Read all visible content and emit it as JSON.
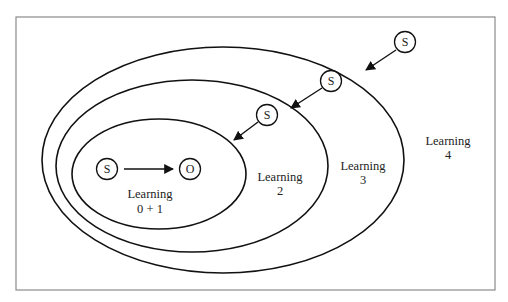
{
  "diagram": {
    "type": "nested-learning-levels",
    "zones": [
      {
        "id": "learning-0-1",
        "line1": "Learning",
        "line2": "0 + 1"
      },
      {
        "id": "learning-2",
        "line1": "Learning",
        "line2": "2"
      },
      {
        "id": "learning-3",
        "line1": "Learning",
        "line2": "3"
      },
      {
        "id": "learning-4",
        "line1": "Learning",
        "line2": "4"
      }
    ],
    "nodes": {
      "inner_stimulus": "S",
      "outcome": "O",
      "stimulus_level_2": "S",
      "stimulus_level_3": "S",
      "stimulus_level_4": "S"
    },
    "edges": [
      {
        "from": "inner_stimulus",
        "to": "outcome"
      },
      {
        "from": "stimulus_level_2",
        "to": "learning-0-1"
      },
      {
        "from": "stimulus_level_3",
        "to": "learning-2"
      },
      {
        "from": "stimulus_level_4",
        "to": "learning-3"
      }
    ],
    "colors": {
      "line": "#111111",
      "frame": "#8a8a8a",
      "background": "#ffffff"
    }
  }
}
